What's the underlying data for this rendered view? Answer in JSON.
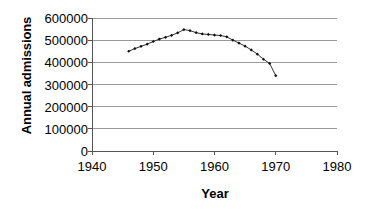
{
  "chart_data": {
    "type": "line",
    "title": "",
    "xlabel": "Year",
    "ylabel": "Annual admissions",
    "xlim": [
      1940,
      1980
    ],
    "ylim": [
      0,
      600000
    ],
    "xticks": [
      1940,
      1950,
      1960,
      1970,
      1980
    ],
    "yticks": [
      0,
      100000,
      200000,
      300000,
      400000,
      500000,
      600000
    ],
    "xtick_labels": [
      "1940",
      "1950",
      "1960",
      "1970",
      "1980"
    ],
    "ytick_labels": [
      "0",
      "100000",
      "200000",
      "300000",
      "400000",
      "500000",
      "600000"
    ],
    "grid": "horizontal",
    "legend": "none",
    "marker": "small-filled-diamond",
    "line_color": "#333333",
    "grid_color": "#999999",
    "axis_color": "#555555",
    "series": [
      {
        "name": "Annual admissions",
        "x": [
          1946,
          1947,
          1948,
          1949,
          1950,
          1951,
          1952,
          1953,
          1954,
          1955,
          1956,
          1957,
          1958,
          1959,
          1960,
          1961,
          1962,
          1963,
          1964,
          1965,
          1966,
          1967,
          1968,
          1969,
          1970
        ],
        "values": [
          450000,
          462000,
          472000,
          482000,
          494000,
          505000,
          513000,
          522000,
          533000,
          548000,
          543000,
          534000,
          528000,
          526000,
          523000,
          521000,
          515000,
          500000,
          487000,
          473000,
          456000,
          437000,
          414000,
          395000,
          340000
        ]
      }
    ]
  },
  "axis": {
    "y_title": "Annual admissions",
    "x_title": "Year"
  }
}
